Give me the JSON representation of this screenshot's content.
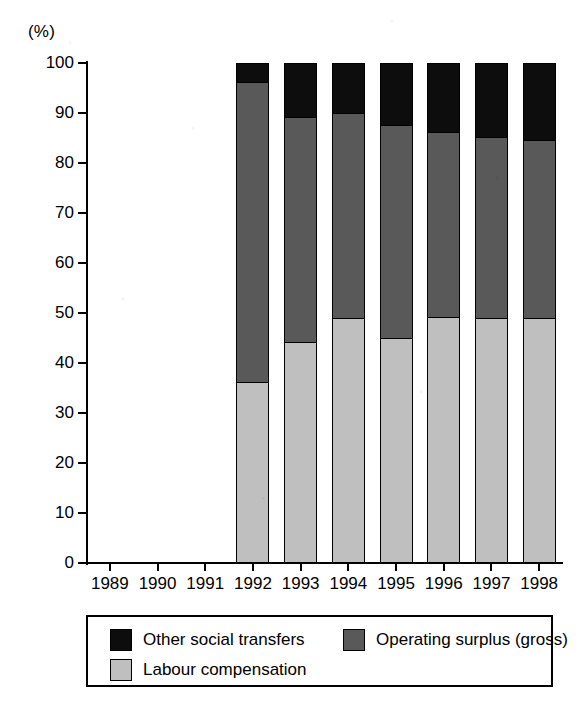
{
  "chart_data": {
    "type": "bar",
    "subtype": "stacked-bar-100",
    "title": "",
    "xlabel": "",
    "ylabel": "(%)",
    "yunit_label": "(%)",
    "categories": [
      "1989",
      "1990",
      "1991",
      "1992",
      "1993",
      "1994",
      "1995",
      "1996",
      "1997",
      "1998"
    ],
    "ylim": [
      0,
      100
    ],
    "yticks": [
      0,
      10,
      20,
      30,
      40,
      50,
      60,
      70,
      80,
      90,
      100
    ],
    "ytick_labels": [
      "0",
      "10",
      "20",
      "30",
      "40",
      "50",
      "60",
      "70",
      "80",
      "90",
      "100"
    ],
    "grid": false,
    "legend_position": "bottom",
    "series": [
      {
        "name": "Labour compensation",
        "color": "#bfbfbf",
        "values": [
          null,
          null,
          null,
          36.5,
          44.5,
          49.3,
          45.2,
          49.5,
          49.3,
          49.3
        ]
      },
      {
        "name": "Operating surplus (gross)",
        "color": "#595959",
        "values": [
          null,
          null,
          null,
          60.0,
          45.0,
          41.0,
          42.7,
          37.0,
          36.2,
          35.5
        ]
      },
      {
        "name": "Other social transfers",
        "color": "#0d0d0d",
        "values": [
          null,
          null,
          null,
          3.5,
          10.5,
          9.7,
          12.1,
          13.5,
          14.5,
          15.2
        ]
      }
    ],
    "cumulative_tops": {
      "labour_compensation": [
        null,
        null,
        null,
        36.5,
        44.5,
        49.3,
        45.2,
        49.5,
        49.3,
        49.3
      ],
      "operating_surplus": [
        null,
        null,
        null,
        96.5,
        89.5,
        90.3,
        87.9,
        86.5,
        85.5,
        84.8
      ],
      "other_social_transfers": [
        null,
        null,
        null,
        100,
        100,
        100,
        100,
        100,
        100,
        100
      ]
    },
    "legend": [
      {
        "label": "Other social transfers",
        "color": "#0d0d0d"
      },
      {
        "label": "Operating surplus (gross)",
        "color": "#595959"
      },
      {
        "label": "Labour compensation",
        "color": "#bfbfbf"
      }
    ]
  }
}
